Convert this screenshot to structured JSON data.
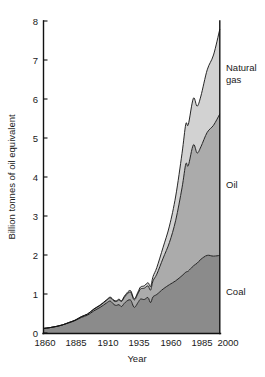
{
  "chart_data": {
    "type": "area",
    "stacked": true,
    "title": "",
    "xlabel": "Year",
    "ylabel": "Billion tonnes of oil equivalent",
    "xlim": [
      1860,
      2000
    ],
    "ylim": [
      0,
      8
    ],
    "xticks": [
      1860,
      1885,
      1910,
      1935,
      1960,
      1985,
      2000
    ],
    "yticks": [
      0,
      1,
      2,
      3,
      4,
      5,
      6,
      7,
      8
    ],
    "grid": false,
    "legend_position": "right-inline",
    "legend_entries": [
      "Natural gas",
      "Oil",
      "Coal"
    ],
    "colors": {
      "natural_gas": "#d2d2d2",
      "oil": "#ababab",
      "coal": "#8b8b8b",
      "outline": "#111111",
      "text": "#1a1a1a"
    },
    "x": [
      1860,
      1865,
      1870,
      1875,
      1880,
      1885,
      1890,
      1895,
      1900,
      1905,
      1910,
      1913,
      1916,
      1918,
      1920,
      1922,
      1925,
      1929,
      1932,
      1935,
      1937,
      1940,
      1943,
      1945,
      1947,
      1950,
      1955,
      1960,
      1965,
      1970,
      1973,
      1975,
      1979,
      1982,
      1985,
      1990,
      1995,
      2000
    ],
    "series": [
      {
        "name": "Coal",
        "values": [
          0.13,
          0.15,
          0.18,
          0.22,
          0.27,
          0.33,
          0.41,
          0.47,
          0.58,
          0.67,
          0.78,
          0.83,
          0.74,
          0.72,
          0.74,
          0.69,
          0.8,
          0.86,
          0.67,
          0.79,
          0.88,
          0.87,
          0.92,
          0.79,
          0.94,
          1.0,
          1.14,
          1.25,
          1.35,
          1.48,
          1.57,
          1.6,
          1.73,
          1.8,
          1.9,
          2.0,
          1.98,
          2.0
        ]
      },
      {
        "name": "Oil",
        "values": [
          0.0,
          0.0,
          0.0,
          0.0,
          0.01,
          0.01,
          0.02,
          0.03,
          0.04,
          0.05,
          0.07,
          0.08,
          0.09,
          0.1,
          0.12,
          0.13,
          0.16,
          0.2,
          0.19,
          0.23,
          0.26,
          0.29,
          0.3,
          0.32,
          0.41,
          0.52,
          0.79,
          1.08,
          1.55,
          2.25,
          2.77,
          2.7,
          3.1,
          2.82,
          2.88,
          3.15,
          3.35,
          3.62
        ]
      },
      {
        "name": "Natural gas",
        "values": [
          0.0,
          0.0,
          0.0,
          0.0,
          0.0,
          0.0,
          0.0,
          0.0,
          0.01,
          0.01,
          0.01,
          0.02,
          0.02,
          0.02,
          0.02,
          0.02,
          0.03,
          0.04,
          0.03,
          0.04,
          0.05,
          0.06,
          0.08,
          0.09,
          0.11,
          0.17,
          0.28,
          0.42,
          0.62,
          0.88,
          1.02,
          1.05,
          1.19,
          1.2,
          1.3,
          1.6,
          1.8,
          2.17
        ]
      }
    ],
    "cumulative_totals": [
      0.13,
      0.15,
      0.18,
      0.22,
      0.28,
      0.34,
      0.43,
      0.5,
      0.63,
      0.73,
      0.86,
      0.93,
      0.85,
      0.84,
      0.88,
      0.84,
      0.99,
      1.1,
      0.89,
      1.06,
      1.19,
      1.22,
      1.3,
      1.2,
      1.46,
      1.69,
      2.21,
      2.75,
      3.52,
      4.61,
      5.36,
      5.35,
      6.02,
      5.82,
      6.08,
      6.75,
      7.13,
      7.79
    ]
  },
  "labels": {
    "natural_gas_line1": "Natural",
    "natural_gas_line2": "gas",
    "oil": "Oil",
    "coal": "Coal",
    "y_axis_title": "Billion tonnes of oil equivalent",
    "x_axis_title": "Year",
    "y_tick_0": "0",
    "y_tick_1": "1",
    "y_tick_2": "2",
    "y_tick_3": "3",
    "y_tick_4": "4",
    "y_tick_5": "5",
    "y_tick_6": "6",
    "y_tick_7": "7",
    "y_tick_8": "8",
    "x_tick_0": "1860",
    "x_tick_1": "1885",
    "x_tick_2": "1910",
    "x_tick_3": "1935",
    "x_tick_4": "1960",
    "x_tick_5": "1985",
    "x_tick_6": "2000"
  }
}
